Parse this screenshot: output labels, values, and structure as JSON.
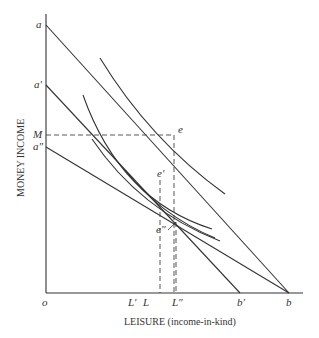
{
  "diagram": {
    "type": "economics-indifference-curve-diagram",
    "axes": {
      "x_label": "LEISURE (income-in-kind)",
      "y_label": "MONEY INCOME",
      "origin_label": "o"
    },
    "y_axis_labels": {
      "a": "a",
      "a_prime": "a'",
      "M": "M",
      "a_double_prime": "a\""
    },
    "x_axis_labels": {
      "L_prime": "L'",
      "L": "L",
      "L_double_prime": "L\"",
      "b_prime": "b'",
      "b": "b"
    },
    "points": {
      "e": "e",
      "e_prime": "e'",
      "e_double_prime": "e\""
    },
    "budget_lines": [
      {
        "name": "ab",
        "from": "a",
        "to": "b"
      },
      {
        "name": "a'b'",
        "from": "a'",
        "to": "b'"
      },
      {
        "name": "a\"b",
        "from": "a\"",
        "to": "b"
      }
    ],
    "indifference_curves": [
      {
        "name": "curve-through-e"
      },
      {
        "name": "curve-through-e-prime"
      },
      {
        "name": "curve-through-e-double-prime"
      },
      {
        "name": "curve-near-e-double-prime-lower"
      }
    ]
  }
}
